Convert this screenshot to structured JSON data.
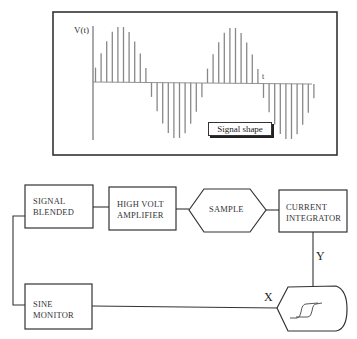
{
  "signal_panel": {
    "y_axis_label": "V(t)",
    "x_axis_label": "t",
    "legend_label": "Signal shape",
    "spikes": [
      6,
      12,
      17,
      21,
      23,
      23,
      21,
      17,
      12,
      6,
      -6,
      -12,
      -17,
      -21,
      -23,
      -23,
      -21,
      -17,
      -12,
      -6,
      6,
      12,
      17,
      21,
      23,
      23,
      21,
      17,
      12,
      6,
      -6,
      -12,
      -17,
      -21,
      -23,
      -23,
      -21,
      -17,
      -12,
      -6
    ]
  },
  "diagram": {
    "blocks": {
      "signal_blended": {
        "line1": "SIGNAL",
        "line2": "BLENDED"
      },
      "high_volt_amplifier": {
        "line1": "HIGH VOLT",
        "line2": "AMPLIFIER"
      },
      "sample": {
        "line1": "SAMPLE"
      },
      "current_integrator": {
        "line1": "CURRENT",
        "line2": "INTEGRATOR"
      },
      "sine_monitor": {
        "line1": "SINE",
        "line2": "MONITOR"
      }
    },
    "oscilloscope": {
      "x_input": "X",
      "y_input": "Y"
    }
  }
}
